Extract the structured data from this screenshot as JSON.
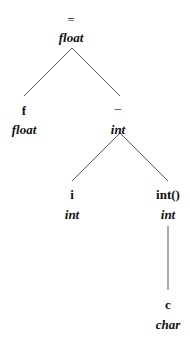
{
  "diagram": {
    "type": "syntax-tree",
    "nodes": [
      {
        "id": "assign",
        "label": "=",
        "type": "float",
        "x": 71,
        "y": 19,
        "ty_y": 37
      },
      {
        "id": "f",
        "label": "f",
        "type": "float",
        "x": 24,
        "y": 110,
        "ty_y": 129
      },
      {
        "id": "minus",
        "label": "–",
        "type": "int",
        "x": 118,
        "y": 108,
        "ty_y": 129
      },
      {
        "id": "i",
        "label": "i",
        "type": "int",
        "x": 72,
        "y": 194,
        "ty_y": 214
      },
      {
        "id": "cast",
        "label": "int()",
        "type": "int",
        "x": 168,
        "y": 194,
        "ty_y": 214
      },
      {
        "id": "c",
        "label": "c",
        "type": "char",
        "x": 168,
        "y": 304,
        "ty_y": 324
      }
    ],
    "edges": [
      {
        "from": "assign",
        "to": "f"
      },
      {
        "from": "assign",
        "to": "minus"
      },
      {
        "from": "minus",
        "to": "i"
      },
      {
        "from": "minus",
        "to": "cast"
      },
      {
        "from": "cast",
        "to": "c"
      }
    ],
    "line_color": "#555555"
  }
}
